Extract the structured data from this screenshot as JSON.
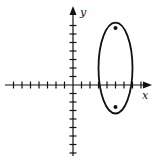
{
  "figure": {
    "type": "coordinate-plane-with-ellipse",
    "colors": {
      "ink": "#111111",
      "background": "#ffffff"
    },
    "axes": {
      "x_label": "x",
      "y_label": "y",
      "origin_px": [
        73,
        85
      ],
      "tick_spacing_px": 8.5,
      "x_ticks": {
        "negative": 7,
        "positive": 8
      },
      "y_ticks": {
        "positive": 7,
        "negative": 8
      }
    },
    "ellipse": {
      "center_units": [
        5,
        2
      ],
      "semi_axis_x_units": 2,
      "semi_axis_y_units": 5.35,
      "orientation": "vertical"
    },
    "foci": [
      {
        "label": "upper-focus",
        "units": [
          5,
          6.7
        ]
      },
      {
        "label": "lower-focus",
        "units": [
          5,
          -2.6
        ]
      }
    ]
  }
}
